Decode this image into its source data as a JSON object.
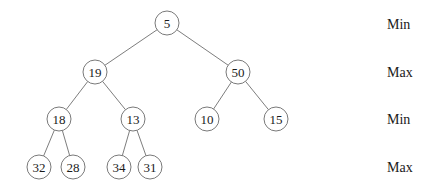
{
  "diagram": {
    "type": "min-max-heap-tree",
    "nodes": [
      {
        "id": "n0",
        "value": "5",
        "x": 167,
        "y": 23,
        "r": 12
      },
      {
        "id": "n1",
        "value": "19",
        "x": 95,
        "y": 72,
        "r": 12
      },
      {
        "id": "n2",
        "value": "50",
        "x": 238,
        "y": 72,
        "r": 12
      },
      {
        "id": "n3",
        "value": "18",
        "x": 59,
        "y": 119,
        "r": 12
      },
      {
        "id": "n4",
        "value": "13",
        "x": 133,
        "y": 119,
        "r": 12
      },
      {
        "id": "n5",
        "value": "10",
        "x": 207,
        "y": 119,
        "r": 12
      },
      {
        "id": "n6",
        "value": "15",
        "x": 276,
        "y": 119,
        "r": 12
      },
      {
        "id": "n7",
        "value": "32",
        "x": 39,
        "y": 167,
        "r": 12
      },
      {
        "id": "n8",
        "value": "28",
        "x": 73,
        "y": 167,
        "r": 12
      },
      {
        "id": "n9",
        "value": "34",
        "x": 119,
        "y": 167,
        "r": 12
      },
      {
        "id": "n10",
        "value": "31",
        "x": 150,
        "y": 167,
        "r": 12
      }
    ],
    "edges": [
      [
        "n0",
        "n1"
      ],
      [
        "n0",
        "n2"
      ],
      [
        "n1",
        "n3"
      ],
      [
        "n1",
        "n4"
      ],
      [
        "n2",
        "n5"
      ],
      [
        "n2",
        "n6"
      ],
      [
        "n3",
        "n7"
      ],
      [
        "n3",
        "n8"
      ],
      [
        "n4",
        "n9"
      ],
      [
        "n4",
        "n10"
      ]
    ],
    "level_labels": [
      {
        "text": "Min",
        "y": 24
      },
      {
        "text": "Max",
        "y": 72
      },
      {
        "text": "Min",
        "y": 119
      },
      {
        "text": "Max",
        "y": 167
      }
    ],
    "label_x": 387
  }
}
